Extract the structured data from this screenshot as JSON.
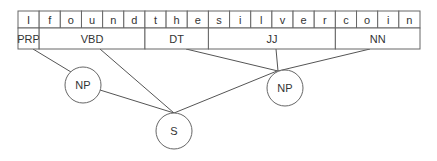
{
  "sentence": {
    "letters": [
      "I",
      "f",
      "o",
      "u",
      "n",
      "d",
      "t",
      "h",
      "e",
      "s",
      "i",
      "l",
      "v",
      "e",
      "r",
      "c",
      "o",
      "i",
      "n"
    ]
  },
  "pos_tags": [
    {
      "label": "PRP",
      "start": 0,
      "end": 1
    },
    {
      "label": "VBD",
      "start": 1,
      "end": 6
    },
    {
      "label": "DT",
      "start": 6,
      "end": 9
    },
    {
      "label": "JJ",
      "start": 9,
      "end": 15
    },
    {
      "label": "NN",
      "start": 15,
      "end": 19
    }
  ],
  "nodes": [
    {
      "id": "np1",
      "label": "NP",
      "cx": 83,
      "cy": 85,
      "r": 18
    },
    {
      "id": "s",
      "label": "S",
      "cx": 174,
      "cy": 131,
      "r": 18
    },
    {
      "id": "np2",
      "label": "NP",
      "cx": 285,
      "cy": 88,
      "r": 18
    }
  ],
  "edges": [
    {
      "from": "PRP",
      "to": "np1"
    },
    {
      "from": "VBD",
      "to": "s"
    },
    {
      "from": "np1",
      "to": "s"
    },
    {
      "from": "DT",
      "to": "np2"
    },
    {
      "from": "JJ",
      "to": "np2"
    },
    {
      "from": "NN",
      "to": "np2"
    },
    {
      "from": "np2",
      "to": "s"
    }
  ]
}
